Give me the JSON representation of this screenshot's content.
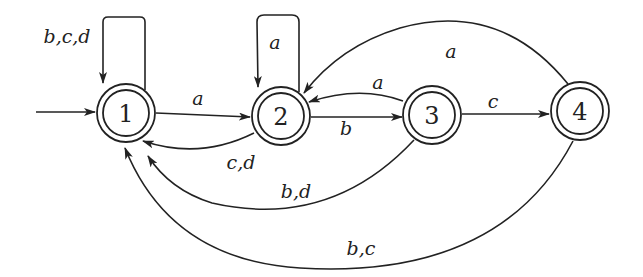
{
  "diagram": {
    "type": "finite-automaton",
    "states": [
      {
        "id": "1",
        "label": "1",
        "initial": true,
        "accepting": true
      },
      {
        "id": "2",
        "label": "2",
        "initial": false,
        "accepting": true
      },
      {
        "id": "3",
        "label": "3",
        "initial": false,
        "accepting": true
      },
      {
        "id": "4",
        "label": "4",
        "initial": false,
        "accepting": true
      }
    ],
    "transitions": [
      {
        "from": "1",
        "to": "1",
        "label": "b,c,d"
      },
      {
        "from": "1",
        "to": "2",
        "label": "a"
      },
      {
        "from": "2",
        "to": "2",
        "label": "a"
      },
      {
        "from": "2",
        "to": "1",
        "label": "c,d"
      },
      {
        "from": "2",
        "to": "3",
        "label": "b"
      },
      {
        "from": "3",
        "to": "2",
        "label": "a"
      },
      {
        "from": "3",
        "to": "4",
        "label": "c"
      },
      {
        "from": "3",
        "to": "1",
        "label": "b,d"
      },
      {
        "from": "4",
        "to": "2",
        "label": "a"
      },
      {
        "from": "4",
        "to": "1",
        "label": "b,c"
      }
    ]
  },
  "labels": {
    "s1": "1",
    "s2": "2",
    "s3": "3",
    "s4": "4",
    "e11": "b,c,d",
    "e12": "a",
    "e22": "a",
    "e21": "c,d",
    "e23": "b",
    "e32": "a",
    "e34": "c",
    "e31": "b,d",
    "e42": "a",
    "e41": "b,c"
  }
}
